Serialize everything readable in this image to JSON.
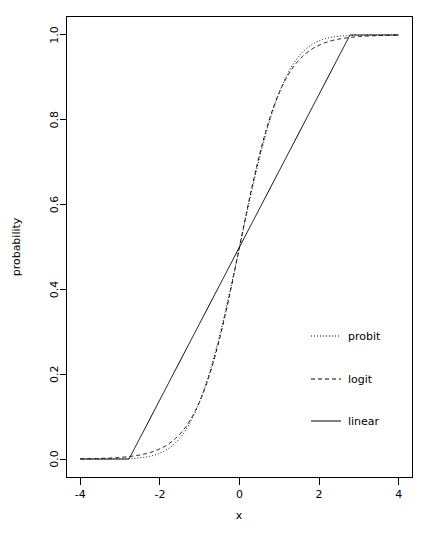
{
  "chart_data": {
    "type": "line",
    "title": "",
    "subtitle": "",
    "xlabel": "x",
    "ylabel": "probability",
    "xlim": [
      -4,
      4
    ],
    "ylim": [
      0.0,
      1.0
    ],
    "grid": false,
    "legend_position": "right-middle",
    "xticks": [
      -4,
      -2,
      0,
      2,
      4
    ],
    "xticklabels": [
      "-4",
      "-2",
      "0",
      "2",
      "4"
    ],
    "yticks": [
      0.0,
      0.2,
      0.4,
      0.6,
      0.8,
      1.0
    ],
    "yticklabels": [
      "0.0",
      "0.2",
      "0.4",
      "0.6",
      "0.8",
      "1.0"
    ],
    "x": [
      -4.0,
      -3.75,
      -3.5,
      -3.25,
      -3.0,
      -2.75,
      -2.5,
      -2.25,
      -2.0,
      -1.75,
      -1.5,
      -1.25,
      -1.0,
      -0.75,
      -0.5,
      -0.25,
      0.0,
      0.25,
      0.5,
      0.75,
      1.0,
      1.25,
      1.5,
      1.75,
      2.0,
      2.25,
      2.5,
      2.75,
      3.0,
      3.25,
      3.5,
      3.75,
      4.0
    ],
    "series": [
      {
        "name": "probit",
        "style": "dotted",
        "color": "#000000",
        "values": [
          0.006,
          0.01,
          0.016,
          0.024,
          0.036,
          0.052,
          0.074,
          0.103,
          0.139,
          0.184,
          0.238,
          0.3,
          0.369,
          0.443,
          0.52,
          0.596,
          0.5,
          0.596,
          0.67,
          0.739,
          0.799,
          0.849,
          0.889,
          0.92,
          0.944,
          0.961,
          0.974,
          0.983,
          0.989,
          0.993,
          0.996,
          0.997,
          0.998
        ]
      },
      {
        "name": "logit",
        "style": "dashed",
        "color": "#000000",
        "values": [
          0.021,
          0.031,
          0.046,
          0.067,
          0.096,
          0.135,
          0.186,
          0.25,
          0.326,
          0.411,
          0.5,
          0.5,
          0.5,
          0.5,
          0.5,
          0.5,
          0.5,
          0.5,
          0.5,
          0.5,
          0.5,
          0.5,
          0.5,
          0.5,
          0.5,
          0.5,
          0.5,
          0.5,
          0.5,
          0.5,
          0.5,
          0.5,
          0.5
        ]
      },
      {
        "name": "linear",
        "style": "solid",
        "color": "#000000",
        "values": [
          0.0,
          0.0,
          0.0,
          0.0,
          0.0,
          0.005,
          0.05,
          0.095,
          0.14,
          0.185,
          0.23,
          0.275,
          0.32,
          0.365,
          0.41,
          0.455,
          0.5,
          0.545,
          0.59,
          0.635,
          0.68,
          0.725,
          0.77,
          0.815,
          0.86,
          0.905,
          0.95,
          0.995,
          1.0,
          1.0,
          1.0,
          1.0,
          1.0
        ]
      }
    ],
    "formulas": {
      "probit": "Phi(1.1*x)",
      "logit": "1/(1+exp(-1.85*x))",
      "linear": "clamp(0.5 + 0.18*x, 0, 1)"
    },
    "linear_knots": {
      "lower_x": -2.78,
      "upper_x": 2.78
    }
  },
  "legend": {
    "entries": [
      {
        "label": "probit",
        "style": "dotted"
      },
      {
        "label": "logit",
        "style": "dashed"
      },
      {
        "label": "linear",
        "style": "solid"
      }
    ]
  },
  "axes": {
    "x_label": "x",
    "y_label": "probability"
  }
}
